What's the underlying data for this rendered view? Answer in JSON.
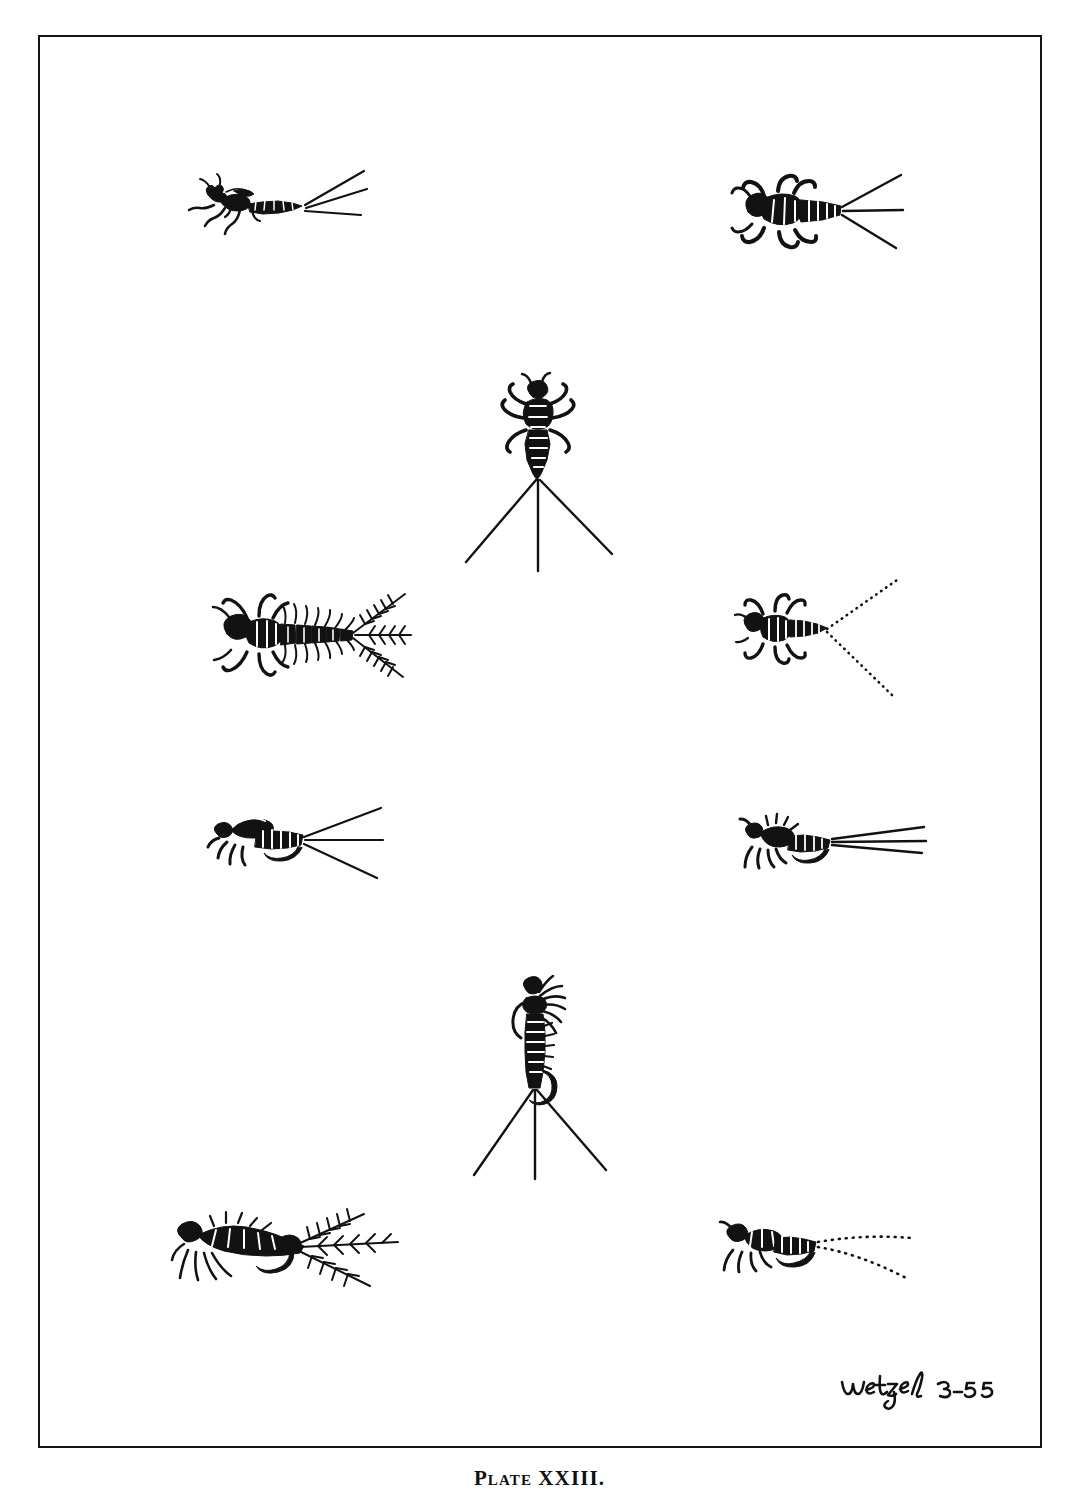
{
  "page": {
    "background_color": "#ffffff",
    "ink_color": "#121212",
    "caption": "Plate XXIII.",
    "signature": {
      "name": "Wetzel",
      "date": "3-55",
      "full": "Wetzel 3-55"
    },
    "frame": {
      "border_color": "#141414",
      "x": 38,
      "y": 35,
      "width": 1004,
      "height": 1413
    }
  },
  "figures": [
    {
      "id": "fig-1",
      "name": "stonefly-nymph-lateral",
      "position": "top-left",
      "description": "Lateral view of a stonefly nymph with three long straight tails trailing to the right",
      "tail_count": 3,
      "tail_style": "solid",
      "view": "lateral",
      "x": 168,
      "y": 158,
      "width": 200,
      "height": 95
    },
    {
      "id": "fig-2",
      "name": "stonefly-nymph-dorsal-broad",
      "position": "top-right",
      "description": "Dorsal view of a broad-bodied nymph with six curled legs and three tails fanning right",
      "tail_count": 3,
      "tail_style": "solid",
      "view": "dorsal",
      "x": 730,
      "y": 160,
      "width": 170,
      "height": 105
    },
    {
      "id": "fig-3",
      "name": "stonefly-nymph-dorsal-vertical",
      "position": "center-upper",
      "description": "Dorsal view of a nymph oriented head-up with three very long tails splayed downward",
      "tail_count": 3,
      "tail_style": "solid",
      "view": "dorsal",
      "x": 460,
      "y": 372,
      "width": 165,
      "height": 195
    },
    {
      "id": "fig-4",
      "name": "gilled-nymph-plumose-tails",
      "position": "left-middle",
      "description": "Dorsal view of a nymph with feathery lateral abdominal gills and three plumose feathered tails",
      "tail_count": 3,
      "tail_style": "plumose",
      "view": "dorsal",
      "x": 205,
      "y": 572,
      "width": 205,
      "height": 120
    },
    {
      "id": "fig-5",
      "name": "nymph-dotted-tails",
      "position": "right-middle",
      "description": "Dorsal view of a small nymph with two tails drawn as fine dotted lines",
      "tail_count": 2,
      "tail_style": "dotted",
      "view": "dorsal",
      "x": 733,
      "y": 568,
      "width": 165,
      "height": 135
    },
    {
      "id": "fig-6",
      "name": "nymph-imitation-stout",
      "position": "left-lower-middle",
      "description": "Lateral view of a stout nymph imitation with three straight tails fanning to the right",
      "tail_count": 3,
      "tail_style": "solid",
      "view": "lateral",
      "x": 205,
      "y": 800,
      "width": 175,
      "height": 80
    },
    {
      "id": "fig-7",
      "name": "artificial-fly-on-hook-lateral",
      "position": "right-lower-middle",
      "description": "Artificial nymph fly tied on a hook, hook bend visible below, with three tails to the right",
      "tail_count": 3,
      "tail_style": "solid",
      "view": "lateral",
      "x": 738,
      "y": 805,
      "width": 185,
      "height": 85
    },
    {
      "id": "fig-8",
      "name": "artificial-fly-on-hook-vertical",
      "position": "center-lower",
      "description": "Artificial nymph fly on a hook shown vertically with hackle at top and three long tails splayed below",
      "tail_count": 3,
      "tail_style": "solid",
      "view": "lateral-vertical",
      "x": 470,
      "y": 970,
      "width": 150,
      "height": 205
    },
    {
      "id": "fig-9",
      "name": "artificial-fly-hackled-plumose-tails",
      "position": "bottom-left",
      "description": "Artificial nymph fly on a hook with long hackle legs at the left and feathery plumose tails at the right",
      "tail_count": 3,
      "tail_style": "plumose",
      "view": "lateral",
      "x": 168,
      "y": 1202,
      "width": 230,
      "height": 95
    },
    {
      "id": "fig-10",
      "name": "artificial-fly-dotted-tails",
      "position": "bottom-right",
      "description": "Artificial nymph fly on a hook with two long curving tails drawn as dotted lines",
      "tail_count": 2,
      "tail_style": "dotted",
      "view": "lateral",
      "x": 718,
      "y": 1208,
      "width": 195,
      "height": 85
    }
  ]
}
